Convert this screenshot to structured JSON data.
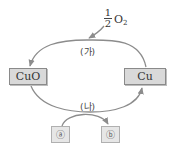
{
  "diagram": {
    "reactant_in": {
      "coefficient_num": "1",
      "coefficient_den": "2",
      "species": "O",
      "subscript": "2"
    },
    "nodes": {
      "left": "CuO",
      "right": "Cu"
    },
    "reactions": {
      "top": "(가)",
      "bottom": "(나)"
    },
    "small_nodes": {
      "a": "ⓐ",
      "b": "ⓑ"
    },
    "colors": {
      "arrow": "#8c8c8c",
      "box_fill": "#d9d9d9",
      "box_border": "#8a8a8a",
      "small_box_fill": "#e6e6e6"
    }
  }
}
